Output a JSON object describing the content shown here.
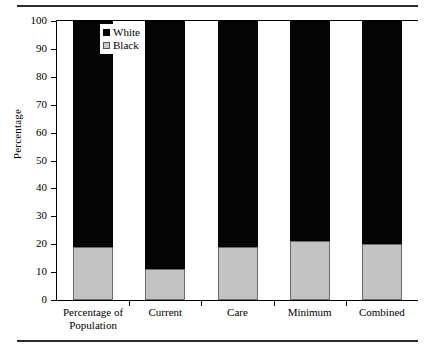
{
  "chart_data": {
    "type": "bar",
    "subtype": "stacked-percentage",
    "title": "",
    "xlabel": "",
    "ylabel": "Percentage",
    "ylim": [
      0,
      100
    ],
    "ytick_values": [
      0,
      10,
      20,
      30,
      40,
      50,
      60,
      70,
      80,
      90,
      100
    ],
    "ytick_labels": [
      "0",
      "10",
      "20",
      "30",
      "40",
      "50",
      "60",
      "70",
      "80",
      "90",
      "100"
    ],
    "grid": false,
    "legend_position": "upper-left-inside",
    "categories": [
      "Percentage of Population",
      "Current",
      "Care",
      "Minimum",
      "Combined"
    ],
    "category_lines": [
      [
        "Percentage of",
        "Population"
      ],
      [
        "Current"
      ],
      [
        "Care"
      ],
      [
        "Minimum"
      ],
      [
        "Combined"
      ]
    ],
    "series": [
      {
        "name": "Black",
        "color": "#c3c3c3",
        "edge_color": "#6b6b6b",
        "stack_order": 0,
        "values": [
          19,
          11,
          19,
          21,
          20
        ]
      },
      {
        "name": "White",
        "color": "#050505",
        "edge_color": "#000000",
        "stack_order": 1,
        "values": [
          81,
          89,
          81,
          79,
          80
        ]
      }
    ],
    "legend": [
      {
        "label": "White",
        "swatch": "black-filled-square"
      },
      {
        "label": "Black",
        "swatch": "gray-filled-square"
      }
    ],
    "annotations": []
  },
  "figure": {
    "background": "#ffffff",
    "rule_color": "#2b2b2b",
    "axis_color": "#000000",
    "top_rule_name": "top-horizontal-rule",
    "bottom_rule_name": "bottom-horizontal-rule"
  }
}
